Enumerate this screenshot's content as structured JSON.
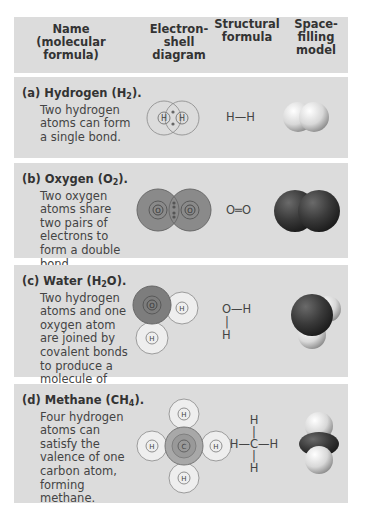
{
  "header": {
    "col_name": [
      "Name",
      "(molecular",
      "formula)"
    ],
    "col_shell": [
      "Electron-",
      "shell",
      "diagram"
    ],
    "col_struct": [
      "Structural",
      "formula"
    ],
    "col_space": [
      "Space-",
      "filling",
      "model"
    ]
  },
  "rows": [
    {
      "label": "(a)",
      "name": "Hydrogen",
      "formula_base": "H",
      "formula_sub": "2",
      "formula_tail": "",
      "description": "Two hydrogen atoms can form a single bond.",
      "structural": "H—H",
      "atom_labels": [
        "H",
        "H"
      ]
    },
    {
      "label": "(b)",
      "name": "Oxygen",
      "formula_base": "O",
      "formula_sub": "2",
      "formula_tail": "",
      "description": "Two oxygen atoms share two pairs of electrons to form a double bond.",
      "structural": "O═O",
      "atom_labels": [
        "O",
        "O"
      ]
    },
    {
      "label": "(c)",
      "name": "Water",
      "formula_base": "H",
      "formula_sub": "2",
      "formula_tail": "O",
      "description": "Two hydrogen atoms and one oxygen atom are joined by covalent bonds to produce a molecule of water.",
      "structural_top": "O—H",
      "structural_bond": "|",
      "structural_bottom": "H",
      "atom_labels": [
        "O",
        "H",
        "H"
      ]
    },
    {
      "label": "(d)",
      "name": "Methane",
      "formula_base": "CH",
      "formula_sub": "4",
      "formula_tail": "",
      "description": "Four hydrogen atoms can satisfy the valence of one carbon atom, forming methane.",
      "structural_top": "H",
      "structural_mid": "H—C—H",
      "structural_bottom": "H",
      "structural_bond": "|",
      "atom_labels": [
        "C",
        "H",
        "H",
        "H",
        "H"
      ]
    }
  ],
  "colors": {
    "panel_bg": "#dcdcdc",
    "oxygen_shell": "#7a7a7a",
    "oxygen_dark": "#3a3a3a",
    "hydrogen_light": "#f2f2f2",
    "carbon_shell": "#a8a8a8"
  }
}
